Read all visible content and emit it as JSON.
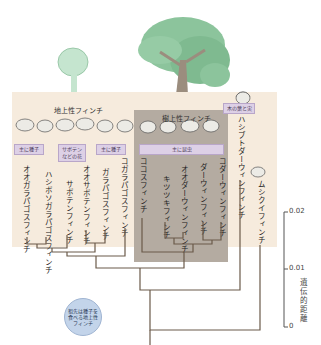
{
  "groups": {
    "ground": {
      "title": "地上性フィンチ"
    },
    "tree": {
      "title": "樹上性フィンチ"
    }
  },
  "diet_tags": {
    "seeds_left": "主に種子",
    "cactus_flowers": "サボテンなどの花",
    "seeds_right": "主に種子",
    "insects": "主に昆虫",
    "leaves_fruit": "木の葉と実"
  },
  "species": [
    {
      "name": "オオガラパゴスフィンチ"
    },
    {
      "name": "ハシボソガラパゴスフィンチ"
    },
    {
      "name": "サボテンフィンチ"
    },
    {
      "name": "オオサボテンフィンチ"
    },
    {
      "name": "ガラパゴスフィンチ"
    },
    {
      "name": "コガラパゴスフィンチ"
    },
    {
      "name": "ココスフィンチ"
    },
    {
      "name": "キツツキフィンチ"
    },
    {
      "name": "オオダーウィンフィンチ"
    },
    {
      "name": "ダーウィンフィンチ"
    },
    {
      "name": "コダーウィンフィンチ"
    },
    {
      "name": "ハシブトダーウィンフィンチ"
    },
    {
      "name": "ムシクイフィンチ"
    }
  ],
  "ancestor": {
    "label": "祖先は種子を食べる地上性フィンチ"
  },
  "axis": {
    "title": "遺伝的距離",
    "ticks": [
      "0.02",
      "0.01",
      "0"
    ]
  },
  "colors": {
    "ground_panel": "#f6ebdd",
    "tree_panel": "#b4aba1",
    "tag_fill": "#ddd0e6",
    "ancestor_fill": "#c3d4ea",
    "line": "#6b5a4a"
  }
}
